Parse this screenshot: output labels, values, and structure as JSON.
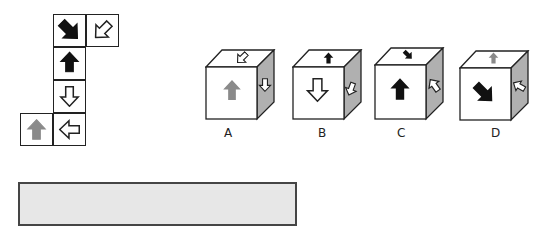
{
  "net": {
    "squares": [
      {
        "id": "top-left",
        "arrow": "down-right",
        "fill": "black"
      },
      {
        "id": "top-right",
        "arrow": "down-left",
        "fill": "white"
      },
      {
        "id": "middle-1",
        "arrow": "up",
        "fill": "black"
      },
      {
        "id": "middle-2",
        "arrow": "down",
        "fill": "white"
      },
      {
        "id": "bottom-right",
        "arrow": "left",
        "fill": "white"
      },
      {
        "id": "bottom-left",
        "arrow": "up",
        "fill": "gray"
      }
    ]
  },
  "options": [
    {
      "label": "A",
      "front": {
        "arrow": "up",
        "fill": "gray"
      },
      "top": {
        "arrow": "down-left",
        "fill": "white"
      },
      "side": {
        "arrow": "down",
        "fill": "white"
      }
    },
    {
      "label": "B",
      "front": {
        "arrow": "down",
        "fill": "white"
      },
      "top": {
        "arrow": "up",
        "fill": "black"
      },
      "side": {
        "arrow": "down-left",
        "fill": "white"
      }
    },
    {
      "label": "C",
      "front": {
        "arrow": "up",
        "fill": "black"
      },
      "top": {
        "arrow": "down-right",
        "fill": "black"
      },
      "side": {
        "arrow": "up-left",
        "fill": "white"
      }
    },
    {
      "label": "D",
      "front": {
        "arrow": "down-right",
        "fill": "black"
      },
      "top": {
        "arrow": "up",
        "fill": "gray"
      },
      "side": {
        "arrow": "left",
        "fill": "white"
      }
    }
  ],
  "colors": {
    "black": "#111111",
    "gray": "#8a8a8a",
    "white": "#ffffff",
    "side_face": "#b0b0b0",
    "answer_box_fill": "#e7e7e7",
    "answer_box_border": "#454545"
  },
  "answer_box": {
    "value": ""
  }
}
